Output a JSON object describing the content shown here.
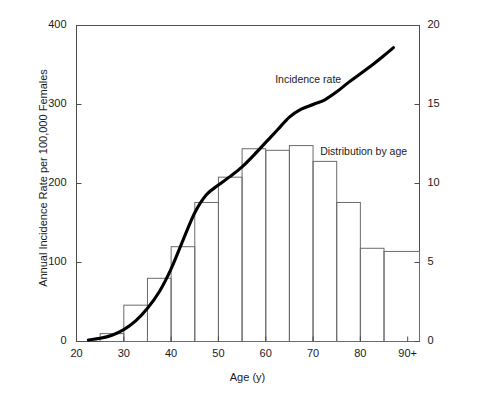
{
  "chart_data": {
    "type": "bar",
    "title": "",
    "xlabel": "Age (y)",
    "ylabel": "Annual Incidence Rate per 100,000 Females",
    "ylabel_right": "Percentage of Total Cases",
    "xlim": [
      20,
      92.5
    ],
    "ylim": [
      0,
      400
    ],
    "ylim_right": [
      0,
      20
    ],
    "grid": false,
    "x_ticks": [
      "20",
      "30",
      "40",
      "50",
      "60",
      "70",
      "80",
      "90+"
    ],
    "x_tick_values": [
      20,
      30,
      40,
      50,
      60,
      70,
      80,
      90
    ],
    "y_ticks_left": [
      "0",
      "100",
      "200",
      "300",
      "400"
    ],
    "y_tick_values_left": [
      0,
      100,
      200,
      300,
      400
    ],
    "y_ticks_right": [
      "0",
      "5",
      "10",
      "15",
      "20"
    ],
    "y_tick_values_right": [
      0,
      5,
      10,
      15,
      20
    ],
    "legend": [
      {
        "name": "Incidence rate",
        "type": "line"
      },
      {
        "name": "Distribution by age",
        "type": "bar"
      }
    ],
    "annotations": [
      {
        "text": "Incidence rate",
        "x": 62.0,
        "y": 330
      },
      {
        "text": "Distribution by age",
        "x": 71.5,
        "y": 238
      }
    ],
    "series": [
      {
        "name": "Distribution by age",
        "type": "bar",
        "axis": "right",
        "unit": "percent",
        "bins": [
          {
            "start": 25,
            "end": 30,
            "value": 0.5
          },
          {
            "start": 30,
            "end": 35,
            "value": 2.3
          },
          {
            "start": 35,
            "end": 40,
            "value": 4.0
          },
          {
            "start": 40,
            "end": 45,
            "value": 6.0
          },
          {
            "start": 45,
            "end": 50,
            "value": 8.8
          },
          {
            "start": 50,
            "end": 55,
            "value": 10.4
          },
          {
            "start": 55,
            "end": 60,
            "value": 12.2
          },
          {
            "start": 60,
            "end": 65,
            "value": 12.1
          },
          {
            "start": 65,
            "end": 70,
            "value": 12.4
          },
          {
            "start": 70,
            "end": 75,
            "value": 11.4
          },
          {
            "start": 75,
            "end": 80,
            "value": 8.8
          },
          {
            "start": 80,
            "end": 85,
            "value": 5.9
          },
          {
            "start": 85,
            "end": 92.5,
            "value": 5.7
          }
        ]
      },
      {
        "name": "Incidence rate",
        "type": "line",
        "axis": "left",
        "unit": "per 100,000 females",
        "points": [
          {
            "x": 22.5,
            "y": 2
          },
          {
            "x": 25,
            "y": 4
          },
          {
            "x": 27.5,
            "y": 8
          },
          {
            "x": 30,
            "y": 15
          },
          {
            "x": 32.5,
            "y": 26
          },
          {
            "x": 35,
            "y": 42
          },
          {
            "x": 37.5,
            "y": 63
          },
          {
            "x": 40,
            "y": 92
          },
          {
            "x": 42.5,
            "y": 128
          },
          {
            "x": 45,
            "y": 163
          },
          {
            "x": 47.5,
            "y": 186
          },
          {
            "x": 50,
            "y": 198
          },
          {
            "x": 52.5,
            "y": 209
          },
          {
            "x": 55,
            "y": 221
          },
          {
            "x": 57.5,
            "y": 236
          },
          {
            "x": 60,
            "y": 252
          },
          {
            "x": 62.5,
            "y": 268
          },
          {
            "x": 65,
            "y": 284
          },
          {
            "x": 67.5,
            "y": 294
          },
          {
            "x": 70,
            "y": 300
          },
          {
            "x": 72.5,
            "y": 306
          },
          {
            "x": 75,
            "y": 316
          },
          {
            "x": 77.5,
            "y": 328
          },
          {
            "x": 80,
            "y": 339
          },
          {
            "x": 82.5,
            "y": 350
          },
          {
            "x": 85,
            "y": 362
          },
          {
            "x": 87,
            "y": 372
          }
        ]
      }
    ]
  },
  "style": {
    "axis_color": "#4d4d4d",
    "bar_edge_color": "#6b6b6b",
    "line_color": "#000000",
    "text_color": "#1a1a1a",
    "background": "#ffffff"
  }
}
